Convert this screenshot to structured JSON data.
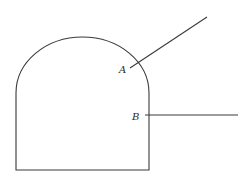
{
  "diagram": {
    "shape": "arched-doorway-outline",
    "labels": {
      "a": "A",
      "b": "B"
    },
    "points": {
      "A": {
        "description": "point on the arched top where a slanted line meets the curve"
      },
      "B": {
        "description": "point on the right vertical side where a horizontal line meets it"
      }
    },
    "colors": {
      "stroke": "#3a3a3a",
      "background": "#ffffff"
    }
  }
}
